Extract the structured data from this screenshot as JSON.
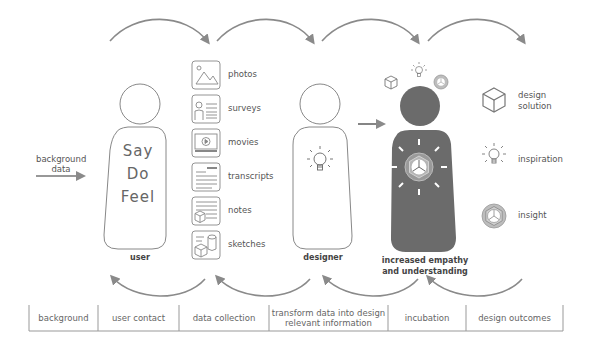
{
  "input": {
    "label_line1": "background",
    "label_line2": "data"
  },
  "user": {
    "words": [
      "Say",
      "Do",
      "Feel"
    ],
    "label": "user"
  },
  "sources": [
    {
      "icon": "photo-icon",
      "label": "photos"
    },
    {
      "icon": "survey-icon",
      "label": "surveys"
    },
    {
      "icon": "movie-icon",
      "label": "movies"
    },
    {
      "icon": "transcript-icon",
      "label": "transcripts"
    },
    {
      "icon": "notes-icon",
      "label": "notes"
    },
    {
      "icon": "sketch-icon",
      "label": "sketches"
    }
  ],
  "designer": {
    "label": "designer"
  },
  "empathy": {
    "label_line1": "increased empathy",
    "label_line2": "and understanding",
    "fill_color": "#6b6b6b"
  },
  "outcomes": [
    {
      "icon": "cube-icon",
      "label_line1": "design",
      "label_line2": "solution"
    },
    {
      "icon": "lightbulb-icon",
      "label_line1": "inspiration",
      "label_line2": ""
    },
    {
      "icon": "insight-icon",
      "label_line1": "insight",
      "label_line2": ""
    }
  ],
  "phases": [
    {
      "label": "background"
    },
    {
      "label": "user contact"
    },
    {
      "label": "data collection"
    },
    {
      "label": "transform data into design relevant information"
    },
    {
      "label": "incubation"
    },
    {
      "label": "design outcomes"
    }
  ],
  "colors": {
    "arrow": "#8a8a8a",
    "outline": "#888888",
    "dark_figure": "#6b6b6b"
  }
}
